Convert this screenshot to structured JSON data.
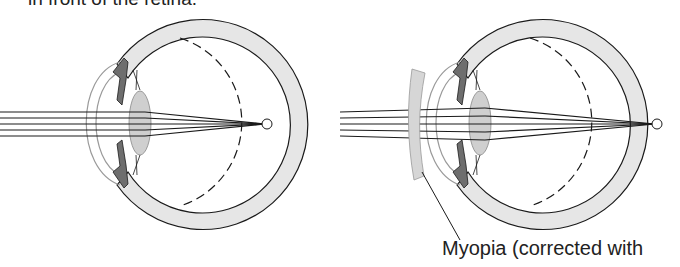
{
  "captions": {
    "top": "in front of the retina.",
    "bottom": "Myopia (corrected with"
  },
  "diagrams": [
    {
      "name": "uncorrected-myopic-eye",
      "corrective_lens": false
    },
    {
      "name": "corrected-myopic-eye",
      "corrective_lens": true
    }
  ],
  "colors": {
    "sclera": "#e6e6e6",
    "iris": "#6e6e6e",
    "lens": "#cfcfcf",
    "stroke": "#1a1a1a",
    "cornea": "#9a9a9a"
  }
}
